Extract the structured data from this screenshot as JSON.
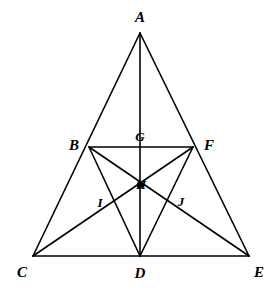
{
  "figure": {
    "width": 273,
    "height": 303,
    "background_color": "#FFFFFF",
    "stroke_color": "#000000",
    "stroke_width": 1.6
  },
  "points": {
    "A": {
      "label": "A",
      "x": 140,
      "y": 33,
      "label_x": 140,
      "label_y": 17,
      "size": "normal"
    },
    "B": {
      "label": "B",
      "x": 89,
      "y": 147,
      "label_x": 74,
      "label_y": 145,
      "size": "normal"
    },
    "C": {
      "label": "C",
      "x": 33,
      "y": 256,
      "label_x": 22,
      "label_y": 272,
      "size": "normal"
    },
    "D": {
      "label": "D",
      "x": 140,
      "y": 256,
      "label_x": 140,
      "label_y": 273,
      "size": "normal"
    },
    "E": {
      "label": "E",
      "x": 249,
      "y": 256,
      "label_x": 259,
      "label_y": 272,
      "size": "normal"
    },
    "F": {
      "label": "F",
      "x": 193,
      "y": 147,
      "label_x": 209,
      "label_y": 145,
      "size": "normal"
    },
    "G": {
      "label": "G",
      "x": 140,
      "y": 147,
      "label_x": 140,
      "label_y": 136,
      "size": "small"
    },
    "H": {
      "label": "H",
      "x": 140,
      "y": 185,
      "label_x": 141,
      "label_y": 184,
      "size": "small"
    },
    "I": {
      "label": "I",
      "x": 105,
      "y": 207,
      "label_x": 100,
      "label_y": 202,
      "size": "small"
    },
    "J": {
      "label": "J",
      "x": 175,
      "y": 207,
      "label_x": 181,
      "label_y": 201,
      "size": "small"
    }
  },
  "segments": [
    {
      "name": "A-C",
      "from": "A",
      "to": "C"
    },
    {
      "name": "A-E",
      "from": "A",
      "to": "E"
    },
    {
      "name": "A-D",
      "from": "A",
      "to": "D"
    },
    {
      "name": "C-E",
      "from": "C",
      "to": "E"
    },
    {
      "name": "B-F",
      "from": "B",
      "to": "F"
    },
    {
      "name": "B-D",
      "from": "B",
      "to": "D"
    },
    {
      "name": "F-D",
      "from": "F",
      "to": "D"
    },
    {
      "name": "B-E",
      "from": "B",
      "to": "E"
    },
    {
      "name": "C-F",
      "from": "C",
      "to": "F"
    }
  ],
  "labels_order": [
    "A",
    "B",
    "C",
    "D",
    "E",
    "F",
    "G",
    "H",
    "I",
    "J"
  ]
}
